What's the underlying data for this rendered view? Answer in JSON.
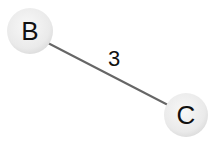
{
  "graph": {
    "nodes": [
      {
        "id": "B",
        "label": "B",
        "cx": 30,
        "cy": 31,
        "r": 23
      },
      {
        "id": "C",
        "label": "C",
        "cx": 186,
        "cy": 115,
        "r": 22
      }
    ],
    "edges": [
      {
        "from": "B",
        "to": "C",
        "weight": "3"
      }
    ]
  },
  "colors": {
    "node_fill": "#ececec",
    "node_edge": "#d8d8d8",
    "edge_stroke": "#666666",
    "text": "#111111"
  }
}
